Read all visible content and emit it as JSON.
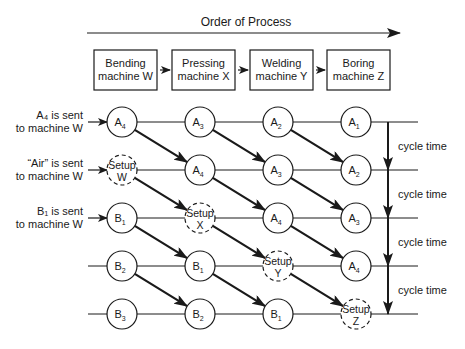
{
  "header": {
    "title": "Order of Process"
  },
  "machines": [
    {
      "line1": "Bending",
      "line2": "machine W"
    },
    {
      "line1": "Pressing",
      "line2": "machine X"
    },
    {
      "line1": "Welding",
      "line2": "machine Y"
    },
    {
      "line1": "Boring",
      "line2": "machine Z"
    }
  ],
  "row_labels": [
    {
      "line1": "A₄ is sent",
      "line2": "to machine W"
    },
    {
      "line1": "“Air” is sent",
      "line2": "to machine W"
    },
    {
      "line1": "B₁ is sent",
      "line2": "to machine W"
    }
  ],
  "rows": [
    [
      {
        "label": "A",
        "sub": "4"
      },
      {
        "label": "A",
        "sub": "3"
      },
      {
        "label": "A",
        "sub": "2"
      },
      {
        "label": "A",
        "sub": "1"
      }
    ],
    [
      {
        "setup": "W"
      },
      {
        "label": "A",
        "sub": "4"
      },
      {
        "label": "A",
        "sub": "3"
      },
      {
        "label": "A",
        "sub": "2"
      }
    ],
    [
      {
        "label": "B",
        "sub": "1"
      },
      {
        "setup": "X"
      },
      {
        "label": "A",
        "sub": "4"
      },
      {
        "label": "A",
        "sub": "3"
      }
    ],
    [
      {
        "label": "B",
        "sub": "2"
      },
      {
        "label": "B",
        "sub": "1"
      },
      {
        "setup": "Y"
      },
      {
        "label": "A",
        "sub": "4"
      }
    ],
    [
      {
        "label": "B",
        "sub": "3"
      },
      {
        "label": "B",
        "sub": "2"
      },
      {
        "label": "B",
        "sub": "1"
      },
      {
        "setup": "Z"
      }
    ]
  ],
  "setup_text": "Setup",
  "cycle_label": "cycle time",
  "cycle_count": 4
}
